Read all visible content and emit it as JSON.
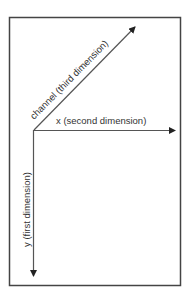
{
  "diagram": {
    "axes": {
      "x": {
        "label": "x (second dimension)",
        "direction": "right"
      },
      "y": {
        "label": "y (first dimension)",
        "direction": "down"
      },
      "channel": {
        "label": "channel (third dimension)",
        "direction": "diagonal-up-right"
      }
    },
    "colors": {
      "border": "#444444",
      "arrow": "#555555",
      "text": "#333333"
    }
  }
}
